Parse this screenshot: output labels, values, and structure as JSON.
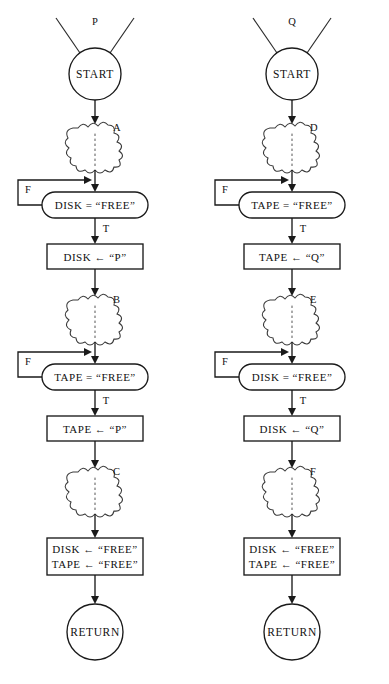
{
  "diagram": {
    "type": "flowchart",
    "background_color": "#ffffff",
    "line_color": "#1a1a1a",
    "columns": [
      {
        "id": "process-p",
        "process_label": "P",
        "start_label": "START",
        "return_label": "RETURN",
        "steps": [
          {
            "kind": "cloud",
            "caption": "A"
          },
          {
            "kind": "test",
            "text": "DISK  =  “FREE”",
            "false_label": "F",
            "true_label": "T"
          },
          {
            "kind": "assign",
            "lines": [
              "DISK  ←  “P”"
            ]
          },
          {
            "kind": "cloud",
            "caption": "B"
          },
          {
            "kind": "test",
            "text": "TAPE  =  “FREE”",
            "false_label": "F",
            "true_label": "T"
          },
          {
            "kind": "assign",
            "lines": [
              "TAPE  ←  “P”"
            ]
          },
          {
            "kind": "cloud",
            "caption": "C"
          },
          {
            "kind": "assign",
            "lines": [
              "DISK  ←  “FREE”",
              "TAPE  ←  “FREE”"
            ]
          }
        ]
      },
      {
        "id": "process-q",
        "process_label": "Q",
        "start_label": "START",
        "return_label": "RETURN",
        "steps": [
          {
            "kind": "cloud",
            "caption": "D"
          },
          {
            "kind": "test",
            "text": "TAPE  =  “FREE”",
            "false_label": "F",
            "true_label": "T"
          },
          {
            "kind": "assign",
            "lines": [
              "TAPE  ←  “Q”"
            ]
          },
          {
            "kind": "cloud",
            "caption": "E"
          },
          {
            "kind": "test",
            "text": "DISK  =  “FREE”",
            "false_label": "F",
            "true_label": "T"
          },
          {
            "kind": "assign",
            "lines": [
              "DISK  ←  “Q”"
            ]
          },
          {
            "kind": "cloud",
            "caption": "F"
          },
          {
            "kind": "assign",
            "lines": [
              "DISK  ←  “FREE”",
              "TAPE  ←  “FREE”"
            ]
          }
        ]
      }
    ]
  }
}
